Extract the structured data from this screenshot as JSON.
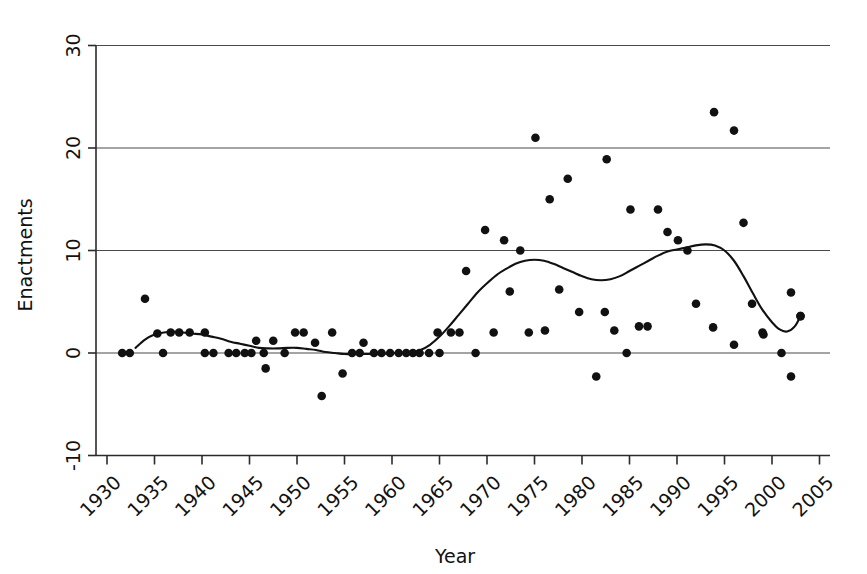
{
  "chart_data": {
    "type": "scatter",
    "title": "",
    "xlabel": "Year",
    "ylabel": "Enactments",
    "xlim": [
      1930,
      2006
    ],
    "ylim": [
      -10,
      30
    ],
    "grid": true,
    "gridlines_y": [
      0,
      10,
      20,
      30
    ],
    "legend": "none",
    "xticks": [
      1930,
      1935,
      1940,
      1945,
      1950,
      1955,
      1960,
      1965,
      1970,
      1975,
      1980,
      1985,
      1990,
      1995,
      2000,
      2005
    ],
    "xtick_labels": [
      "1930",
      "1935",
      "1940",
      "1945",
      "1950",
      "1955",
      "1960",
      "1965",
      "1970",
      "1975",
      "1980",
      "1985",
      "1990",
      "1995",
      "2000",
      "2005"
    ],
    "xtick_rotation": 45,
    "yticks": [
      -10,
      0,
      10,
      20,
      30
    ],
    "ytick_labels": [
      "-10",
      "0",
      "10",
      "20",
      "30"
    ],
    "marker": "filled-circle",
    "marker_color": "#111111",
    "points": [
      {
        "x": 1931.6,
        "y": 0.0
      },
      {
        "x": 1932.4,
        "y": 0.0
      },
      {
        "x": 1934.0,
        "y": 5.3
      },
      {
        "x": 1935.3,
        "y": 1.9
      },
      {
        "x": 1935.9,
        "y": 0.0
      },
      {
        "x": 1936.7,
        "y": 2.0
      },
      {
        "x": 1937.6,
        "y": 2.0
      },
      {
        "x": 1938.7,
        "y": 2.0
      },
      {
        "x": 1940.3,
        "y": 2.0
      },
      {
        "x": 1940.3,
        "y": 0.0
      },
      {
        "x": 1941.2,
        "y": 0.0
      },
      {
        "x": 1942.8,
        "y": 0.0
      },
      {
        "x": 1943.6,
        "y": 0.0
      },
      {
        "x": 1944.5,
        "y": 0.0
      },
      {
        "x": 1945.2,
        "y": 0.0
      },
      {
        "x": 1945.7,
        "y": 1.2
      },
      {
        "x": 1946.5,
        "y": 0.0
      },
      {
        "x": 1946.7,
        "y": -1.5
      },
      {
        "x": 1947.5,
        "y": 1.2
      },
      {
        "x": 1948.7,
        "y": 0.0
      },
      {
        "x": 1949.8,
        "y": 2.0
      },
      {
        "x": 1950.7,
        "y": 2.0
      },
      {
        "x": 1951.9,
        "y": 1.0
      },
      {
        "x": 1952.6,
        "y": -4.2
      },
      {
        "x": 1953.7,
        "y": 2.0
      },
      {
        "x": 1954.8,
        "y": -2.0
      },
      {
        "x": 1955.8,
        "y": 0.0
      },
      {
        "x": 1956.6,
        "y": 0.0
      },
      {
        "x": 1957.0,
        "y": 1.0
      },
      {
        "x": 1958.1,
        "y": 0.0
      },
      {
        "x": 1958.9,
        "y": 0.0
      },
      {
        "x": 1959.8,
        "y": 0.0
      },
      {
        "x": 1960.7,
        "y": 0.0
      },
      {
        "x": 1961.5,
        "y": 0.0
      },
      {
        "x": 1962.2,
        "y": 0.0
      },
      {
        "x": 1962.9,
        "y": 0.0
      },
      {
        "x": 1963.9,
        "y": 0.0
      },
      {
        "x": 1964.8,
        "y": 2.0
      },
      {
        "x": 1965.0,
        "y": 0.0
      },
      {
        "x": 1966.2,
        "y": 2.0
      },
      {
        "x": 1967.1,
        "y": 2.0
      },
      {
        "x": 1967.8,
        "y": 8.0
      },
      {
        "x": 1968.8,
        "y": 0.0
      },
      {
        "x": 1969.8,
        "y": 12.0
      },
      {
        "x": 1970.7,
        "y": 2.0
      },
      {
        "x": 1971.8,
        "y": 11.0
      },
      {
        "x": 1972.4,
        "y": 6.0
      },
      {
        "x": 1973.5,
        "y": 10.0
      },
      {
        "x": 1974.4,
        "y": 2.0
      },
      {
        "x": 1975.1,
        "y": 21.0
      },
      {
        "x": 1976.1,
        "y": 2.2
      },
      {
        "x": 1976.6,
        "y": 15.0
      },
      {
        "x": 1977.6,
        "y": 6.2
      },
      {
        "x": 1978.5,
        "y": 17.0
      },
      {
        "x": 1979.7,
        "y": 4.0
      },
      {
        "x": 1981.5,
        "y": -2.3
      },
      {
        "x": 1982.4,
        "y": 4.0
      },
      {
        "x": 1982.6,
        "y": 18.9
      },
      {
        "x": 1983.4,
        "y": 2.2
      },
      {
        "x": 1984.7,
        "y": 0.0
      },
      {
        "x": 1985.1,
        "y": 14.0
      },
      {
        "x": 1986.0,
        "y": 2.6
      },
      {
        "x": 1986.9,
        "y": 2.6
      },
      {
        "x": 1988.0,
        "y": 14.0
      },
      {
        "x": 1989.0,
        "y": 11.8
      },
      {
        "x": 1990.1,
        "y": 11.0
      },
      {
        "x": 1991.1,
        "y": 10.0
      },
      {
        "x": 1992.0,
        "y": 4.8
      },
      {
        "x": 1993.8,
        "y": 2.5
      },
      {
        "x": 1993.9,
        "y": 23.5
      },
      {
        "x": 1996.0,
        "y": 21.7
      },
      {
        "x": 1996.0,
        "y": 0.8
      },
      {
        "x": 1997.0,
        "y": 12.7
      },
      {
        "x": 1997.9,
        "y": 4.8
      },
      {
        "x": 1999.0,
        "y": 2.0
      },
      {
        "x": 1999.1,
        "y": 1.8
      },
      {
        "x": 2001.0,
        "y": 0.0
      },
      {
        "x": 2002.0,
        "y": -2.3
      },
      {
        "x": 2002.0,
        "y": 5.9
      },
      {
        "x": 2003.0,
        "y": 3.6
      }
    ],
    "trend_line": {
      "name": "smoothed-trend",
      "color": "#111111",
      "points": [
        {
          "x": 1933.0,
          "y": 0.5
        },
        {
          "x": 1934.0,
          "y": 1.3
        },
        {
          "x": 1935.0,
          "y": 1.8
        },
        {
          "x": 1936.0,
          "y": 2.0
        },
        {
          "x": 1937.0,
          "y": 2.1
        },
        {
          "x": 1938.0,
          "y": 2.0
        },
        {
          "x": 1939.0,
          "y": 1.9
        },
        {
          "x": 1940.0,
          "y": 1.8
        },
        {
          "x": 1941.0,
          "y": 1.6
        },
        {
          "x": 1942.0,
          "y": 1.4
        },
        {
          "x": 1943.0,
          "y": 1.1
        },
        {
          "x": 1944.0,
          "y": 0.9
        },
        {
          "x": 1945.0,
          "y": 0.7
        },
        {
          "x": 1946.0,
          "y": 0.5
        },
        {
          "x": 1947.0,
          "y": 0.45
        },
        {
          "x": 1948.0,
          "y": 0.45
        },
        {
          "x": 1949.0,
          "y": 0.5
        },
        {
          "x": 1950.0,
          "y": 0.5
        },
        {
          "x": 1951.0,
          "y": 0.4
        },
        {
          "x": 1952.0,
          "y": 0.3
        },
        {
          "x": 1953.0,
          "y": 0.1
        },
        {
          "x": 1954.0,
          "y": 0.0
        },
        {
          "x": 1955.0,
          "y": -0.1
        },
        {
          "x": 1956.0,
          "y": -0.1
        },
        {
          "x": 1957.0,
          "y": -0.1
        },
        {
          "x": 1958.0,
          "y": -0.1
        },
        {
          "x": 1959.0,
          "y": -0.1
        },
        {
          "x": 1960.0,
          "y": 0.0
        },
        {
          "x": 1961.0,
          "y": 0.0
        },
        {
          "x": 1962.0,
          "y": 0.1
        },
        {
          "x": 1963.0,
          "y": 0.3
        },
        {
          "x": 1964.0,
          "y": 0.8
        },
        {
          "x": 1965.0,
          "y": 1.6
        },
        {
          "x": 1966.0,
          "y": 2.6
        },
        {
          "x": 1967.0,
          "y": 3.7
        },
        {
          "x": 1968.0,
          "y": 4.8
        },
        {
          "x": 1969.0,
          "y": 5.9
        },
        {
          "x": 1970.0,
          "y": 6.8
        },
        {
          "x": 1971.0,
          "y": 7.6
        },
        {
          "x": 1972.0,
          "y": 8.2
        },
        {
          "x": 1973.0,
          "y": 8.7
        },
        {
          "x": 1974.0,
          "y": 9.0
        },
        {
          "x": 1975.0,
          "y": 9.1
        },
        {
          "x": 1976.0,
          "y": 9.0
        },
        {
          "x": 1977.0,
          "y": 8.7
        },
        {
          "x": 1978.0,
          "y": 8.3
        },
        {
          "x": 1979.0,
          "y": 7.9
        },
        {
          "x": 1980.0,
          "y": 7.5
        },
        {
          "x": 1981.0,
          "y": 7.2
        },
        {
          "x": 1982.0,
          "y": 7.1
        },
        {
          "x": 1983.0,
          "y": 7.2
        },
        {
          "x": 1984.0,
          "y": 7.5
        },
        {
          "x": 1985.0,
          "y": 8.0
        },
        {
          "x": 1986.0,
          "y": 8.5
        },
        {
          "x": 1987.0,
          "y": 9.0
        },
        {
          "x": 1988.0,
          "y": 9.5
        },
        {
          "x": 1989.0,
          "y": 9.9
        },
        {
          "x": 1990.0,
          "y": 10.1
        },
        {
          "x": 1991.0,
          "y": 10.3
        },
        {
          "x": 1992.0,
          "y": 10.5
        },
        {
          "x": 1993.0,
          "y": 10.6
        },
        {
          "x": 1994.0,
          "y": 10.5
        },
        {
          "x": 1995.0,
          "y": 10.0
        },
        {
          "x": 1996.0,
          "y": 9.0
        },
        {
          "x": 1997.0,
          "y": 7.5
        },
        {
          "x": 1998.0,
          "y": 5.8
        },
        {
          "x": 1999.0,
          "y": 4.2
        },
        {
          "x": 2000.0,
          "y": 3.0
        },
        {
          "x": 2000.8,
          "y": 2.3
        },
        {
          "x": 2001.6,
          "y": 2.1
        },
        {
          "x": 2002.4,
          "y": 2.6
        },
        {
          "x": 2003.0,
          "y": 3.6
        }
      ],
      "end_marker": {
        "x": 2003.0,
        "y": 3.6
      }
    }
  }
}
